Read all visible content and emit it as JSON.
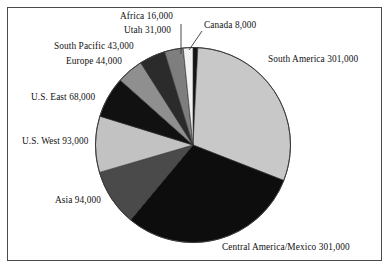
{
  "figure": {
    "background_color": "#ffffff",
    "border_color": "#4a4a4a"
  },
  "chart_data": {
    "type": "pie",
    "title": "",
    "subtitle": "",
    "xlabel": "",
    "ylabel": "",
    "legend_position": "none",
    "grid": false,
    "start_angle_deg": 0,
    "direction": "clockwise",
    "total": 999000,
    "categories": [
      "Canada",
      "South America",
      "Central America/Mexico",
      "Asia",
      "U.S. West",
      "U.S. East",
      "Europe",
      "South Pacific",
      "Utah",
      "Africa"
    ],
    "values": [
      8000,
      301000,
      301000,
      94000,
      93000,
      68000,
      44000,
      43000,
      31000,
      16000
    ],
    "slices": [
      {
        "name": "Canada",
        "value": 8000,
        "value_text": "8,000",
        "label": "Canada 8,000",
        "color": "#141414"
      },
      {
        "name": "South America",
        "value": 301000,
        "value_text": "301,000",
        "label": "South America 301,000",
        "color": "#c8c8c8"
      },
      {
        "name": "Central America/Mexico",
        "value": 301000,
        "value_text": "301,000",
        "label": "Central America/Mexico 301,000",
        "color": "#0d0d0d"
      },
      {
        "name": "Asia",
        "value": 94000,
        "value_text": "94,000",
        "label": "Asia 94,000",
        "color": "#4a4a4a"
      },
      {
        "name": "U.S. West",
        "value": 93000,
        "value_text": "93,000",
        "label": "U.S. West 93,000",
        "color": "#c2c2c2"
      },
      {
        "name": "U.S. East",
        "value": 68000,
        "value_text": "68,000",
        "label": "U.S. East 68,000",
        "color": "#111111"
      },
      {
        "name": "Europe",
        "value": 44000,
        "value_text": "44,000",
        "label": "Europe 44,000",
        "color": "#8f8f8f"
      },
      {
        "name": "South Pacific",
        "value": 43000,
        "value_text": "43,000",
        "label": "South Pacific 43,000",
        "color": "#2b2b2b"
      },
      {
        "name": "Utah",
        "value": 31000,
        "value_text": "31,000",
        "label": "Utah 31,000",
        "color": "#7e7e7e"
      },
      {
        "name": "Africa",
        "value": 16000,
        "value_text": "16,000",
        "label": "Africa 16,000",
        "color": "#f2f2f2"
      }
    ],
    "labels": {
      "africa": "Africa 16,000",
      "utah": "Utah 31,000",
      "canada": "Canada 8,000",
      "south_pacific": "South Pacific 43,000",
      "europe": "Europe 44,000",
      "us_east": "U.S. East 68,000",
      "us_west": "U.S. West 93,000",
      "asia": "Asia 94,000",
      "south_america": "South America 301,000",
      "central_america_mexico": "Central America/Mexico 301,000"
    }
  }
}
